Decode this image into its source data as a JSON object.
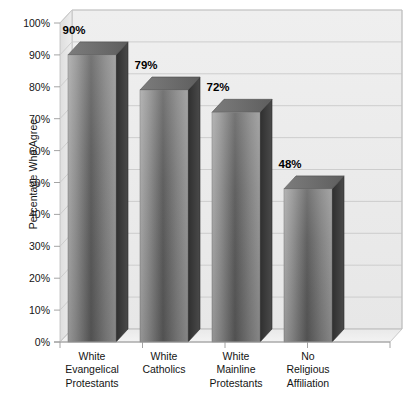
{
  "chart_data": {
    "type": "bar",
    "title": "",
    "subtitle": "",
    "xlabel": "",
    "ylabel": "Percentage Who Agree",
    "categories": [
      "White\nEvangelical\nProtestants",
      "White\nCatholics",
      "White\nMainline\nProtestants",
      "No\nReligious\nAffiliation"
    ],
    "values": [
      90,
      79,
      72,
      48
    ],
    "data_labels": [
      "90%",
      "79%",
      "72%",
      "48%"
    ],
    "ylim": [
      0,
      100
    ],
    "y_ticks": [
      0,
      10,
      20,
      30,
      40,
      50,
      60,
      70,
      80,
      90,
      100
    ],
    "y_tick_labels": [
      "0%",
      "10%",
      "20%",
      "30%",
      "40%",
      "50%",
      "60%",
      "70%",
      "80%",
      "90%",
      "100%"
    ],
    "grid": true,
    "grid_axis": "y",
    "legend": false,
    "legend_position": "none",
    "style": "3d-column",
    "annotations": []
  },
  "colors": {
    "background": "#ffffff",
    "back_wall": "#ebebeb",
    "side_wall": "#e3e3e3",
    "floor": "#e8e8e8",
    "gridline": "#c9c9c9",
    "axis_line": "#9a9a9a",
    "bar_front_light": "#a3a3a3",
    "bar_front_mid": "#5c5c5c",
    "bar_front_edge": "#8e8e8e",
    "bar_side": "#3b3b3b",
    "bar_top": "#6e6e6e",
    "text": "#141414",
    "value_text": "#000000"
  },
  "geometry": {
    "plot_left": 60,
    "plot_right": 390,
    "baseline_y": 342,
    "top_y": 23,
    "depth_x": 12,
    "depth_y": -13,
    "bar_width": 48,
    "bar_slots": [
      68,
      140,
      212,
      284
    ]
  },
  "icons": {
    "y_axis_tick": "tick-mark",
    "gridline": "grid-line"
  }
}
